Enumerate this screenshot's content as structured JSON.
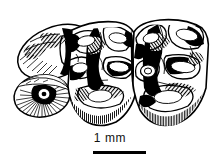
{
  "figure": {
    "kind": "scientific-line-drawing",
    "background_color": "#ffffff",
    "ink_color": "#000000",
    "width_px": 220,
    "height_px": 167
  },
  "illustration": {
    "name": "two-molar-crowns-with-root-section",
    "elements": [
      {
        "name": "left-upper-lobe",
        "description": "large oval cusp lobe upper-left, hatched shading"
      },
      {
        "name": "left-root-cross-section",
        "description": "small oval with dark centre and radiating hatch lines, lower-left"
      },
      {
        "name": "anterior-molar-crown",
        "description": "central molar crown with enamel loops and dentine basins"
      },
      {
        "name": "posterior-molar-crown",
        "description": "right molar crown with enamel loops and dentine basins"
      },
      {
        "name": "crown-base-hatching",
        "description": "vertical hatch shading along the basal margins of both crowns"
      }
    ]
  },
  "scale_bar": {
    "label": "1 mm",
    "value": 1,
    "unit": "mm",
    "bar_color": "#000000",
    "bar_length_px": 53
  }
}
